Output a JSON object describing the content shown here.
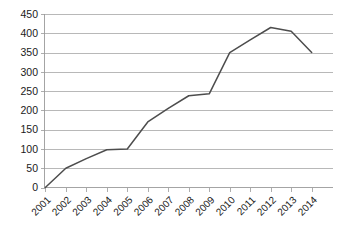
{
  "chart_data": {
    "type": "line",
    "title": "",
    "subtitle": "",
    "xlabel": "",
    "ylabel": "",
    "categories": [
      "2001",
      "2002",
      "2003",
      "2004",
      "2005",
      "2006",
      "2007",
      "2008",
      "2009",
      "2010",
      "2011",
      "2012",
      "2013",
      "2014"
    ],
    "x": [
      2001,
      2002,
      2003,
      2004,
      2005,
      2006,
      2007,
      2008,
      2009,
      2010,
      2011,
      2012,
      2013,
      2014
    ],
    "values": [
      0,
      50,
      75,
      98,
      100,
      170,
      205,
      238,
      243,
      350,
      383,
      415,
      405,
      350
    ],
    "series": [
      {
        "name": "series-1",
        "color": "#4d4d4d",
        "values": [
          0,
          50,
          75,
          98,
          100,
          170,
          205,
          238,
          243,
          350,
          383,
          415,
          405,
          350
        ]
      }
    ],
    "ylim": [
      0,
      450
    ],
    "xlim": [
      2001,
      2014
    ],
    "ytick_labels": [
      "0",
      "50",
      "100",
      "150",
      "200",
      "250",
      "300",
      "350",
      "400",
      "450"
    ],
    "ytick_values": [
      0,
      50,
      100,
      150,
      200,
      250,
      300,
      350,
      400,
      450
    ],
    "xtick_labels": [
      "2001",
      "2002",
      "2003",
      "2004",
      "2005",
      "2006",
      "2007",
      "2008",
      "2009",
      "2010",
      "2011",
      "2012",
      "2013",
      "2014"
    ],
    "grid": true,
    "grid_axis": "y",
    "legend": false,
    "legend_position": "none",
    "gridline_color": "#a6a6a6",
    "axis_color": "#9a9a9a",
    "background_color": "#ffffff",
    "xtick_rotation_deg": 45
  },
  "colors": {
    "line": "#4d4d4d",
    "grid": "#a6a6a6",
    "axis": "#9a9a9a",
    "text": "#1a1a1a",
    "background": "#ffffff"
  }
}
